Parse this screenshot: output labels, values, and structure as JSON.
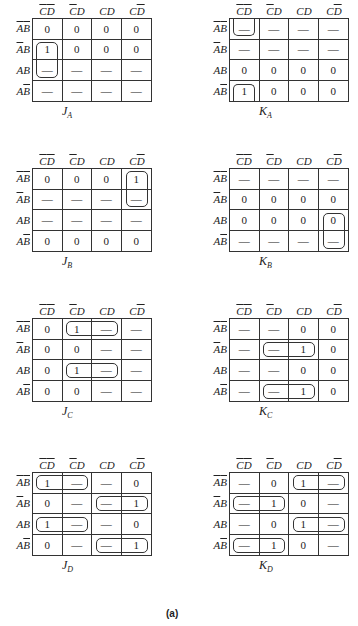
{
  "figure_label": "(a)",
  "column_headers": [
    {
      "parts": [
        {
          "t": "C",
          "bar": true
        },
        {
          "t": "D",
          "bar": true
        }
      ]
    },
    {
      "parts": [
        {
          "t": "C",
          "bar": true
        },
        {
          "t": "D",
          "bar": false
        }
      ]
    },
    {
      "parts": [
        {
          "t": "C",
          "bar": false
        },
        {
          "t": "D",
          "bar": false
        }
      ]
    },
    {
      "parts": [
        {
          "t": "C",
          "bar": false
        },
        {
          "t": "D",
          "bar": true
        }
      ]
    }
  ],
  "row_headers": [
    {
      "parts": [
        {
          "t": "A",
          "bar": true
        },
        {
          "t": "B",
          "bar": true
        }
      ]
    },
    {
      "parts": [
        {
          "t": "A",
          "bar": true
        },
        {
          "t": "B",
          "bar": false
        }
      ]
    },
    {
      "parts": [
        {
          "t": "A",
          "bar": false
        },
        {
          "t": "B",
          "bar": false
        }
      ]
    },
    {
      "parts": [
        {
          "t": "A",
          "bar": false
        },
        {
          "t": "B",
          "bar": true
        }
      ]
    }
  ],
  "column_header_text": [
    "C'D'",
    "C'D",
    "CD",
    "CD'"
  ],
  "row_header_text": [
    "A'B'",
    "A'B",
    "AB",
    "AB'"
  ],
  "maps": [
    {
      "id": "JA",
      "name": "J",
      "sub": "A",
      "x": 0,
      "y": 0,
      "cells": [
        [
          "0",
          "0",
          "0",
          "0"
        ],
        [
          "1",
          "0",
          "0",
          "0"
        ],
        [
          "—",
          "—",
          "—",
          "—"
        ],
        [
          "—",
          "—",
          "—",
          "—"
        ]
      ],
      "loops": [
        {
          "r": 1,
          "c": 0,
          "rs": 2,
          "cs": 1
        }
      ]
    },
    {
      "id": "KA",
      "name": "K",
      "sub": "A",
      "x": 197,
      "y": 0,
      "cells": [
        [
          "—",
          "—",
          "—",
          "—"
        ],
        [
          "—",
          "—",
          "—",
          "—"
        ],
        [
          "0",
          "0",
          "0",
          "0"
        ],
        [
          "1",
          "0",
          "0",
          "0"
        ]
      ],
      "loops": [
        {
          "r": 0,
          "c": 0,
          "rs": 1,
          "cs": 1,
          "open": "top"
        },
        {
          "r": 3,
          "c": 0,
          "rs": 1,
          "cs": 1,
          "open": "bottom"
        }
      ]
    },
    {
      "id": "JB",
      "name": "J",
      "sub": "B",
      "x": 0,
      "y": 150,
      "cells": [
        [
          "0",
          "0",
          "0",
          "1"
        ],
        [
          "—",
          "—",
          "—",
          "—"
        ],
        [
          "—",
          "—",
          "—",
          "—"
        ],
        [
          "0",
          "0",
          "0",
          "0"
        ]
      ],
      "loops": [
        {
          "r": 0,
          "c": 3,
          "rs": 2,
          "cs": 1
        }
      ]
    },
    {
      "id": "KB",
      "name": "K",
      "sub": "B",
      "x": 197,
      "y": 150,
      "cells": [
        [
          "—",
          "—",
          "—",
          "—"
        ],
        [
          "0",
          "0",
          "0",
          "0"
        ],
        [
          "0",
          "0",
          "0",
          "0"
        ],
        [
          "—",
          "—",
          "—",
          "—"
        ]
      ],
      "loops": [
        {
          "r": 2,
          "c": 3,
          "rs": 2,
          "cs": 1
        }
      ]
    },
    {
      "id": "JC",
      "name": "J",
      "sub": "C",
      "x": 0,
      "y": 300,
      "cells": [
        [
          "0",
          "1",
          "—",
          "—"
        ],
        [
          "0",
          "0",
          "—",
          "—"
        ],
        [
          "0",
          "1",
          "—",
          "—"
        ],
        [
          "0",
          "0",
          "—",
          "—"
        ]
      ],
      "loops": [
        {
          "r": 0,
          "c": 1,
          "rs": 1,
          "cs": 2
        },
        {
          "r": 2,
          "c": 1,
          "rs": 1,
          "cs": 2
        }
      ]
    },
    {
      "id": "KC",
      "name": "K",
      "sub": "C",
      "x": 197,
      "y": 300,
      "cells": [
        [
          "—",
          "—",
          "0",
          "0"
        ],
        [
          "—",
          "—",
          "1",
          "0"
        ],
        [
          "—",
          "—",
          "0",
          "0"
        ],
        [
          "—",
          "—",
          "1",
          "0"
        ]
      ],
      "loops": [
        {
          "r": 1,
          "c": 1,
          "rs": 1,
          "cs": 2
        },
        {
          "r": 3,
          "c": 1,
          "rs": 1,
          "cs": 2
        }
      ]
    },
    {
      "id": "JD",
      "name": "J",
      "sub": "D",
      "x": 0,
      "y": 454,
      "cells": [
        [
          "1",
          "—",
          "—",
          "0"
        ],
        [
          "0",
          "—",
          "—",
          "1"
        ],
        [
          "1",
          "—",
          "—",
          "0"
        ],
        [
          "0",
          "—",
          "—",
          "1"
        ]
      ],
      "loops": [
        {
          "r": 0,
          "c": 0,
          "rs": 1,
          "cs": 2
        },
        {
          "r": 2,
          "c": 0,
          "rs": 1,
          "cs": 2
        },
        {
          "r": 1,
          "c": 2,
          "rs": 1,
          "cs": 2
        },
        {
          "r": 3,
          "c": 2,
          "rs": 1,
          "cs": 2
        }
      ]
    },
    {
      "id": "KD",
      "name": "K",
      "sub": "D",
      "x": 197,
      "y": 454,
      "cells": [
        [
          "—",
          "0",
          "1",
          "—"
        ],
        [
          "—",
          "1",
          "0",
          "—"
        ],
        [
          "—",
          "0",
          "1",
          "—"
        ],
        [
          "—",
          "1",
          "0",
          "—"
        ]
      ],
      "loops": [
        {
          "r": 0,
          "c": 2,
          "rs": 1,
          "cs": 2
        },
        {
          "r": 2,
          "c": 2,
          "rs": 1,
          "cs": 2
        },
        {
          "r": 1,
          "c": 0,
          "rs": 1,
          "cs": 2
        },
        {
          "r": 3,
          "c": 0,
          "rs": 1,
          "cs": 2
        }
      ]
    }
  ]
}
